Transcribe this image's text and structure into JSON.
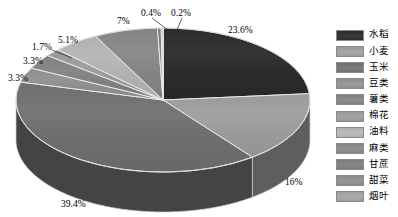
{
  "chart_data": {
    "type": "pie",
    "title": "",
    "subtitle": "",
    "xlabel": "",
    "ylabel": "",
    "legend_position": "right",
    "grid": false,
    "three_d": true,
    "categories": [
      "水稻",
      "小麦",
      "玉米",
      "豆类",
      "薯类",
      "棉花",
      "油料",
      "麻类",
      "甘蔗",
      "甜菜",
      "烟叶"
    ],
    "values": [
      23.6,
      16,
      39.4,
      3.3,
      3.3,
      1.7,
      5.1,
      7,
      0.4,
      0.2,
      0.0
    ],
    "value_labels": [
      "23.6%",
      "16%",
      "39.4%",
      "3.3%",
      "3.3%",
      "1.7%",
      "5.1%",
      "7%",
      "0.4%",
      "0.2%",
      ""
    ],
    "colors": [
      "#2c2c2c",
      "#9a9a9a",
      "#6e6e6e",
      "#8d8d8d",
      "#7f7f7f",
      "#979797",
      "#b0b0b0",
      "#848484",
      "#7a7a7a",
      "#8a8a8a",
      "#9e9e9e"
    ],
    "annotations": []
  },
  "slices": [
    {
      "label": "水稻",
      "pct": "23.6%",
      "color": "#2c2c2c",
      "side": "#141414"
    },
    {
      "label": "小麦",
      "pct": "16%",
      "color": "#9a9a9a",
      "side": "#5e5e5e"
    },
    {
      "label": "玉米",
      "pct": "39.4%",
      "color": "#6e6e6e",
      "side": "#444444"
    },
    {
      "label": "豆类",
      "pct": "3.3%",
      "color": "#8d8d8d",
      "side": "#565656"
    },
    {
      "label": "薯类",
      "pct": "3.3%",
      "color": "#7f7f7f",
      "side": "#4e4e4e"
    },
    {
      "label": "棉花",
      "pct": "1.7%",
      "color": "#979797",
      "side": "#5c5c5c"
    },
    {
      "label": "油料",
      "pct": "5.1%",
      "color": "#b0b0b0",
      "side": "#6b6b6b"
    },
    {
      "label": "麻类",
      "pct": "7%",
      "color": "#848484",
      "side": "#525252"
    },
    {
      "label": "甘蔗",
      "pct": "0.4%",
      "color": "#7a7a7a",
      "side": "#4a4a4a"
    },
    {
      "label": "甜菜",
      "pct": "0.2%",
      "color": "#8a8a8a",
      "side": "#545454"
    },
    {
      "label": "烟叶",
      "pct": "",
      "color": "#9e9e9e",
      "side": "#616161"
    }
  ],
  "pct_labels": [
    {
      "text": "23.6%",
      "x": 228,
      "y": 26
    },
    {
      "text": "16%",
      "x": 285,
      "y": 178
    },
    {
      "text": "39.4%",
      "x": 61,
      "y": 200
    },
    {
      "text": "3.3%",
      "x": 8,
      "y": 74
    },
    {
      "text": "3.3%",
      "x": 23,
      "y": 57
    },
    {
      "text": "1.7%",
      "x": 32,
      "y": 43
    },
    {
      "text": "5.1%",
      "x": 58,
      "y": 36
    },
    {
      "text": "7%",
      "x": 117,
      "y": 17
    },
    {
      "text": "0.4%",
      "x": 141,
      "y": 9
    },
    {
      "text": "0.2%",
      "x": 171,
      "y": 9
    }
  ],
  "legend": {
    "items": [
      {
        "label": "水稻",
        "color": "#2c2c2c"
      },
      {
        "label": "小麦",
        "color": "#9a9a9a"
      },
      {
        "label": "玉米",
        "color": "#6e6e6e"
      },
      {
        "label": "豆类",
        "color": "#8d8d8d"
      },
      {
        "label": "薯类",
        "color": "#7f7f7f"
      },
      {
        "label": "棉花",
        "color": "#979797"
      },
      {
        "label": "油料",
        "color": "#b0b0b0"
      },
      {
        "label": "麻类",
        "color": "#848484"
      },
      {
        "label": "甘蔗",
        "color": "#7a7a7a"
      },
      {
        "label": "甜菜",
        "color": "#8a8a8a"
      },
      {
        "label": "烟叶",
        "color": "#9e9e9e"
      }
    ]
  }
}
